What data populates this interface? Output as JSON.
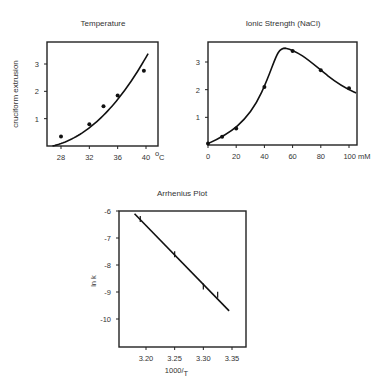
{
  "chart_data": [
    {
      "type": "scatter",
      "title": "Temperature",
      "xlabel": "°C",
      "ylabel": "cruciform extrusion",
      "x_ticks": [
        "28",
        "32",
        "36",
        "40"
      ],
      "x_unit": "°C",
      "y_ticks": [
        "1",
        "2",
        "3"
      ],
      "xlim": [
        26.5,
        42
      ],
      "ylim": [
        0,
        3.8
      ],
      "grid": false,
      "x": [
        28,
        32,
        34,
        36,
        39.7
      ],
      "values": [
        0.35,
        0.8,
        1.45,
        1.85,
        2.75
      ],
      "fit": "smooth increasing curve from (26.8, 0) to (40.3, 3.05)"
    },
    {
      "type": "scatter",
      "title": "Ionic Strength (NaCl)",
      "xlabel": "mM",
      "ylabel": "",
      "x_ticks": [
        "0",
        "20",
        "40",
        "60",
        "80",
        "100 mM"
      ],
      "x_unit": "mM",
      "y_ticks": [
        "1",
        "2",
        "3"
      ],
      "xlim": [
        0,
        105
      ],
      "ylim": [
        0,
        3.8
      ],
      "grid": false,
      "x": [
        0,
        10,
        20,
        40,
        60,
        80,
        100
      ],
      "values": [
        0.05,
        0.3,
        0.6,
        2.1,
        3.4,
        2.7,
        2.05
      ],
      "fit": "peaked curve with maximum ~3.5 near 55 mM"
    },
    {
      "type": "scatter",
      "title": "Arrhenius Plot",
      "xlabel": "1000/T",
      "ylabel": "ln k",
      "x_ticks": [
        "3.20",
        "3.25",
        "3.30",
        "3.35"
      ],
      "y_ticks": [
        "-6",
        "-7",
        "-8",
        "-9",
        "-10"
      ],
      "xlim": [
        3.15,
        3.37
      ],
      "ylim": [
        -11,
        -6
      ],
      "grid": false,
      "x": [
        3.19,
        3.25,
        3.3,
        3.325
      ],
      "values": [
        -6.3,
        -7.6,
        -8.8,
        -9.1
      ],
      "fit": "linear, from (3.18, -6.1) to (3.345, -9.7)"
    }
  ]
}
